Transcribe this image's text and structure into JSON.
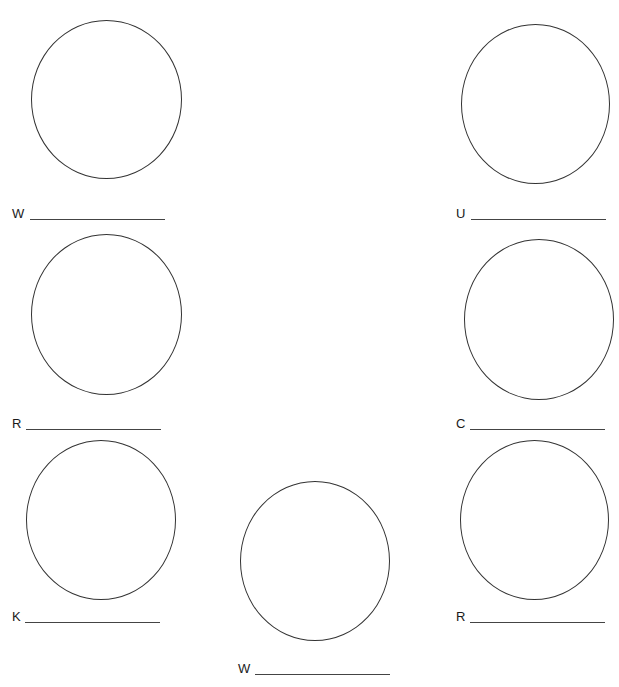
{
  "worksheet": {
    "items": [
      {
        "letter": "W",
        "position": "top-left"
      },
      {
        "letter": "U",
        "position": "top-right"
      },
      {
        "letter": "R",
        "position": "middle-left"
      },
      {
        "letter": "C",
        "position": "middle-right"
      },
      {
        "letter": "K",
        "position": "bottom-left"
      },
      {
        "letter": "R",
        "position": "bottom-right"
      },
      {
        "letter": "W",
        "position": "bottom-center"
      }
    ],
    "colors": {
      "stroke": "#333333",
      "background": "#ffffff",
      "text": "#1a1a1a"
    }
  }
}
